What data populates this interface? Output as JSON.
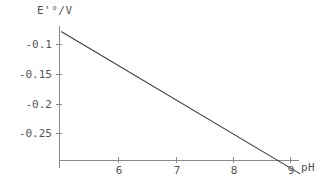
{
  "chart_data": {
    "type": "line",
    "title": "",
    "subtitle": "",
    "xlabel": "pH",
    "ylabel": "E'°/V",
    "xlim": [
      5.0,
      9.2
    ],
    "ylim": [
      -0.32,
      -0.075
    ],
    "grid": false,
    "legend": null,
    "x_ticks": [
      6,
      7,
      8,
      9
    ],
    "x_tick_labels": [
      "6",
      "7",
      "8",
      "9"
    ],
    "y_ticks": [
      -0.1,
      -0.15,
      -0.2,
      -0.25
    ],
    "y_tick_labels": [
      "-0.1",
      "-0.15",
      "-0.2",
      "-0.25"
    ],
    "series": [
      {
        "name": "E'° vs pH",
        "x": [
          5.0,
          9.17
        ],
        "y": [
          -0.078,
          -0.318
        ],
        "slope_v_per_ph": -0.0575,
        "intercept_v": 0.209,
        "x_axis_crossing_ph": 8.68,
        "color": "#3b3b3b",
        "line_width": 1
      }
    ],
    "annotations": []
  },
  "axes": {
    "y_title": "E'°/V",
    "x_title": "pH"
  },
  "ticks": {
    "y": [
      {
        "label": "-0.1"
      },
      {
        "label": "-0.15"
      },
      {
        "label": "-0.2"
      },
      {
        "label": "-0.25"
      }
    ],
    "x": [
      {
        "label": "6"
      },
      {
        "label": "7"
      },
      {
        "label": "8"
      },
      {
        "label": "9"
      }
    ]
  },
  "colors": {
    "axis": "#808080",
    "line": "#3b3b3b",
    "text": "#555555",
    "background": "#ffffff"
  }
}
